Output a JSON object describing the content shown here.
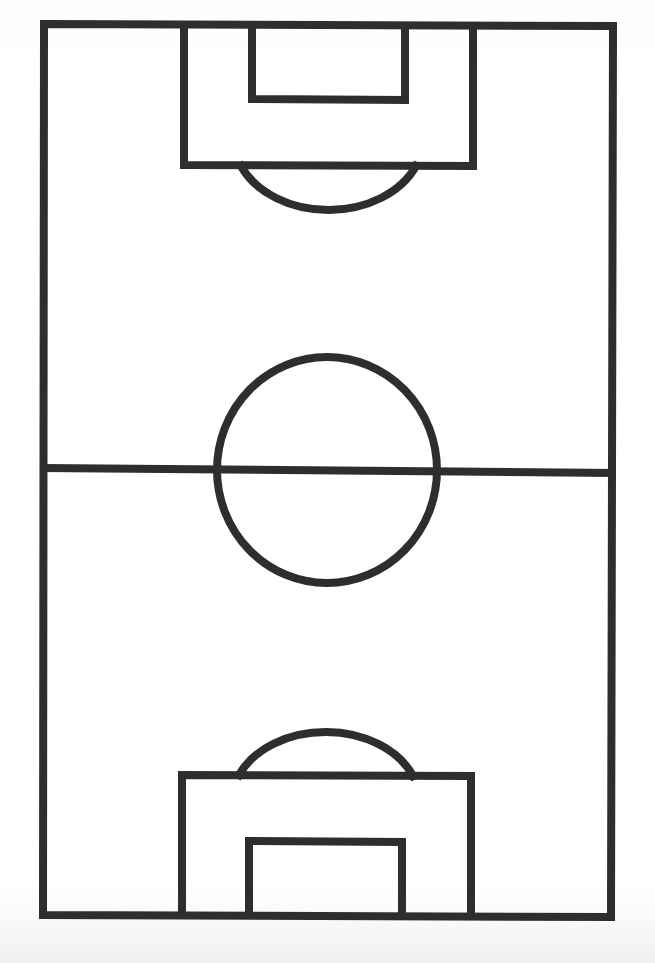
{
  "diagram": {
    "title": "Soccer pitch line diagram",
    "orientation": "vertical",
    "colors": {
      "line": "#2e2e2e",
      "background": "#ffffff"
    },
    "stroke_width": 8,
    "elements": [
      "outer-boundary",
      "halfway-line",
      "center-circle",
      "top-penalty-area",
      "top-goal-area",
      "top-penalty-arc",
      "bottom-penalty-area",
      "bottom-goal-area",
      "bottom-penalty-arc"
    ]
  }
}
